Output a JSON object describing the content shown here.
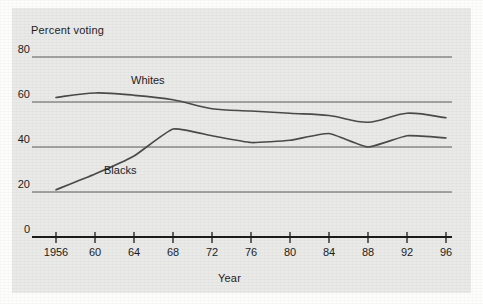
{
  "chart_data": {
    "type": "line",
    "title": "",
    "xlabel": "Year",
    "ylabel": "Percent voting",
    "x": [
      1956,
      1960,
      1964,
      1968,
      1972,
      1976,
      1980,
      1984,
      1988,
      1992,
      1996
    ],
    "xtick_labels": [
      "1956",
      "60",
      "64",
      "68",
      "72",
      "76",
      "80",
      "84",
      "88",
      "92",
      "96"
    ],
    "ytick_labels": [
      "0",
      "20",
      "40",
      "60",
      "80"
    ],
    "ytick_values": [
      0,
      20,
      40,
      60,
      80
    ],
    "ylim": [
      0,
      80
    ],
    "xlim": [
      1956,
      1996
    ],
    "grid": "horizontal",
    "axis_break": "y-axis compressed between 0 and 20",
    "legend": "inline series labels on plot",
    "series": [
      {
        "name": "Whites",
        "label": "Whites",
        "color": "#4a4a4a",
        "values": [
          62,
          64,
          63,
          61,
          57,
          56,
          55,
          54,
          51,
          55,
          53
        ]
      },
      {
        "name": "Blacks",
        "label": "Blacks",
        "color": "#4a4a4a",
        "values": [
          21,
          28,
          36,
          48,
          45,
          42,
          43,
          46,
          40,
          45,
          44
        ]
      }
    ]
  },
  "colors": {
    "page_background": "#fdfdfc",
    "panel_background": "#e9e9e7",
    "gridline": "#5a5a5a",
    "axis": "#1c1c1c",
    "text": "#1c1c1c",
    "line": "#4a4a4a"
  }
}
